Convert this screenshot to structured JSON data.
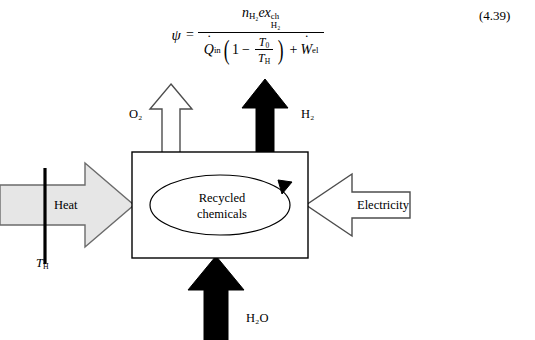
{
  "equation": {
    "lhs_symbol": "ψ",
    "equals": "=",
    "numerator": {
      "ndot_symbol": "n",
      "ndot_sub": "H₂",
      "ex_symbol": "ex",
      "ex_sup": "ch",
      "ex_sub": "H₂"
    },
    "denominator": {
      "qdot_symbol": "Q",
      "qdot_sub": "in",
      "one": "1",
      "minus": "−",
      "t0_symbol": "T",
      "t0_sub": "0",
      "th_symbol": "T",
      "th_sub": "H",
      "plus": "+",
      "wdot_symbol": "W",
      "wdot_sub": "el"
    },
    "number": "(4.39)"
  },
  "diagram": {
    "box": {
      "inner_label_line1": "Recycled",
      "inner_label_line2": "chemicals"
    },
    "flows": {
      "heat": {
        "label": "Heat",
        "direction": "right",
        "style": "gray-filled"
      },
      "electricity": {
        "label": "Electricity",
        "direction": "left",
        "style": "white-filled"
      },
      "oxygen": {
        "label": "O₂",
        "direction": "up",
        "style": "white-filled"
      },
      "hydrogen": {
        "label": "H₂",
        "direction": "up",
        "style": "black-filled"
      },
      "water": {
        "label": "H₂O",
        "direction": "up",
        "style": "black-filled"
      }
    },
    "temperature_marker": {
      "symbol": "T",
      "subscript": "H"
    }
  },
  "colors": {
    "stroke": "#000000",
    "gray_fill": "#e6e6e6",
    "white_fill": "#ffffff",
    "black_fill": "#000000",
    "background": "#ffffff"
  }
}
